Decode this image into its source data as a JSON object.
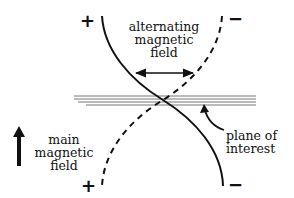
{
  "diagram": {
    "labels": {
      "alternating_field": [
        "alternating",
        "magnetic",
        "field"
      ],
      "main_field": [
        "main",
        "magnetic",
        "field"
      ],
      "plane": [
        "plane of",
        "interest"
      ]
    },
    "signs": {
      "top_left": "+",
      "top_right": "−",
      "bottom_left": "+",
      "bottom_right": "−"
    },
    "colors": {
      "ink": "#111111",
      "plane_lines": "#777777",
      "background": "#ffffff"
    }
  }
}
